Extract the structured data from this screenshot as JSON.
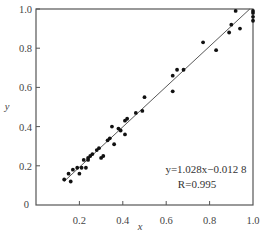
{
  "chart_data": {
    "type": "scatter",
    "title": "",
    "xlabel": "x",
    "ylabel": "y",
    "xlim": [
      0,
      1.0
    ],
    "ylim": [
      0,
      1.0
    ],
    "grid": false,
    "legend": null,
    "x_ticks": [
      "0",
      "0.2",
      "0.4",
      "0.6",
      "0.8",
      "1.0"
    ],
    "y_ticks": [
      "0",
      "0.2",
      "0.4",
      "0.6",
      "0.8",
      "1.0"
    ],
    "annotations": {
      "equation": "y=1.028x−0.012 8",
      "r_value": "R=0.995"
    },
    "fit_line": {
      "slope": 1.028,
      "intercept": -0.0128,
      "x_range": [
        0.13,
        0.985
      ]
    },
    "series": [
      {
        "name": "observed",
        "points": [
          [
            0.13,
            0.13
          ],
          [
            0.15,
            0.16
          ],
          [
            0.16,
            0.12
          ],
          [
            0.17,
            0.18
          ],
          [
            0.19,
            0.19
          ],
          [
            0.2,
            0.16
          ],
          [
            0.21,
            0.19
          ],
          [
            0.22,
            0.23
          ],
          [
            0.23,
            0.19
          ],
          [
            0.24,
            0.23
          ],
          [
            0.24,
            0.24
          ],
          [
            0.25,
            0.25
          ],
          [
            0.26,
            0.26
          ],
          [
            0.28,
            0.28
          ],
          [
            0.29,
            0.29
          ],
          [
            0.3,
            0.24
          ],
          [
            0.31,
            0.25
          ],
          [
            0.33,
            0.33
          ],
          [
            0.34,
            0.34
          ],
          [
            0.35,
            0.4
          ],
          [
            0.36,
            0.31
          ],
          [
            0.38,
            0.39
          ],
          [
            0.39,
            0.38
          ],
          [
            0.41,
            0.36
          ],
          [
            0.41,
            0.43
          ],
          [
            0.42,
            0.44
          ],
          [
            0.46,
            0.47
          ],
          [
            0.49,
            0.48
          ],
          [
            0.5,
            0.55
          ],
          [
            0.63,
            0.66
          ],
          [
            0.63,
            0.58
          ],
          [
            0.65,
            0.69
          ],
          [
            0.68,
            0.69
          ],
          [
            0.77,
            0.83
          ],
          [
            0.83,
            0.79
          ],
          [
            0.89,
            0.88
          ],
          [
            0.9,
            0.92
          ],
          [
            0.92,
            0.99
          ],
          [
            0.94,
            0.9
          ],
          [
            1.0,
            0.99
          ],
          [
            1.0,
            0.98
          ],
          [
            1.0,
            0.96
          ],
          [
            1.0,
            0.94
          ]
        ]
      }
    ]
  },
  "plot_area": {
    "left": 36,
    "top": 9,
    "right": 253,
    "bottom": 205
  },
  "colors": {
    "axis": "#555555",
    "points": "#111111",
    "line": "#444444"
  }
}
